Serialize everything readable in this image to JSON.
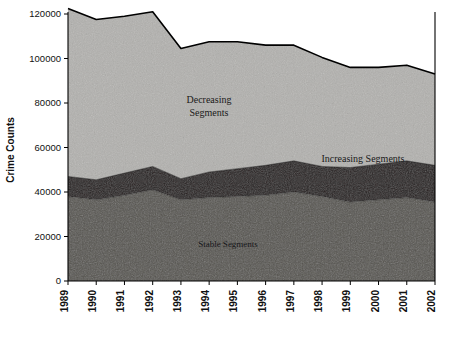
{
  "chart_data": {
    "type": "area",
    "stacked": true,
    "title": "",
    "xlabel": "",
    "ylabel": "Crime Counts",
    "grid": false,
    "legend_position": "in-plot-annotations",
    "x": [
      "1989",
      "1990",
      "1991",
      "1992",
      "1993",
      "1994",
      "1995",
      "1996",
      "1997",
      "1998",
      "1999",
      "2000",
      "2001",
      "2002"
    ],
    "categories": [
      "1989",
      "1990",
      "1991",
      "1992",
      "1993",
      "1994",
      "1995",
      "1996",
      "1997",
      "1998",
      "1999",
      "2000",
      "2001",
      "2002"
    ],
    "ylim": [
      0,
      120000
    ],
    "yticks": [
      0,
      20000,
      40000,
      60000,
      80000,
      100000,
      120000
    ],
    "ytick_labels": [
      "0",
      "20000",
      "40000",
      "60000",
      "80000",
      "100000",
      "120000"
    ],
    "series": [
      {
        "name": "Stable Segments",
        "color": "#56544f",
        "values": [
          38000,
          36500,
          38500,
          41000,
          36500,
          37500,
          38000,
          38500,
          40000,
          38000,
          35500,
          36500,
          37500,
          35500
        ]
      },
      {
        "name": "Increasing Segments",
        "color": "#241d1d",
        "values": [
          9000,
          9000,
          10000,
          10500,
          9500,
          11500,
          12500,
          13500,
          14000,
          13500,
          15500,
          16000,
          16500,
          16500
        ]
      },
      {
        "name": "Decreasing Segments",
        "color": "#b2b1ae",
        "values": [
          75500,
          72000,
          70500,
          69500,
          58500,
          58500,
          57000,
          54000,
          52000,
          49000,
          45000,
          43500,
          43000,
          41000
        ]
      }
    ],
    "stack_totals": [
      122500,
      117500,
      119000,
      121000,
      104500,
      107500,
      107500,
      106000,
      106000,
      100500,
      96000,
      96000,
      97000,
      93000
    ],
    "annotations": [
      {
        "name": "decreasing-label",
        "text_line1": "Decreasing",
        "text_line2": "Segments",
        "x": 1993.2,
        "y": 86000
      },
      {
        "name": "increasing-label",
        "text_line1": "Increasing Segments",
        "text_line2": "",
        "x": 1998.6,
        "y": 60500
      },
      {
        "name": "stable-label",
        "text_line1": "Stable Segments",
        "text_line2": "",
        "x": 1994.3,
        "y": 22000
      }
    ]
  },
  "axes": {
    "y_title": "Crime Counts",
    "y_ticks": [
      "0",
      "20000",
      "40000",
      "60000",
      "80000",
      "100000",
      "120000"
    ],
    "x_ticks": [
      "1989",
      "1990",
      "1991",
      "1992",
      "1993",
      "1994",
      "1995",
      "1996",
      "1997",
      "1998",
      "1999",
      "2000",
      "2001",
      "2002"
    ]
  },
  "labels": {
    "decreasing_line1": "Decreasing",
    "decreasing_line2": "Segments",
    "increasing": "Increasing Segments",
    "stable": "Stable Segments"
  },
  "colors": {
    "decreasing": "#b2b1ae",
    "increasing": "#241d1d",
    "stable": "#56544f",
    "outline": "#000000",
    "background": "#ffffff"
  }
}
